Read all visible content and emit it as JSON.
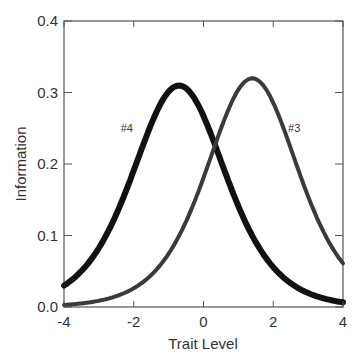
{
  "chart_data": {
    "type": "line",
    "title": "",
    "xlabel": "Trait Level",
    "ylabel": "Information",
    "xlim": [
      -4,
      4
    ],
    "ylim": [
      0,
      0.4
    ],
    "x_ticks": [
      -4,
      -2,
      0,
      2,
      4
    ],
    "x_tick_labels": [
      "-4",
      "-2",
      "0",
      "2",
      "4"
    ],
    "y_ticks": [
      0.0,
      0.1,
      0.2,
      0.3,
      0.4
    ],
    "y_tick_labels": [
      "0.0",
      "0.1",
      "0.2",
      "0.3",
      "0.4"
    ],
    "grid": false,
    "legend": "none (inline curve labels)",
    "x": [
      -4,
      -3.5,
      -3,
      -2.5,
      -2,
      -1.5,
      -1,
      -0.7,
      -0.5,
      0,
      0.3,
      0.5,
      1,
      1.4,
      1.5,
      2,
      2.5,
      3,
      3.5,
      4
    ],
    "series": [
      {
        "name": "#4",
        "color": "#111111",
        "stroke_width": 6,
        "peak": {
          "x": -0.7,
          "y": 0.31
        },
        "values": [
          0.03,
          0.05,
          0.08,
          0.123,
          0.177,
          0.238,
          0.289,
          0.31,
          0.305,
          0.265,
          0.226,
          0.196,
          0.135,
          0.093,
          0.085,
          0.05,
          0.028,
          0.016,
          0.009,
          0.007
        ],
        "label_pos": {
          "x": -2.2,
          "y": 0.245
        }
      },
      {
        "name": "#3",
        "color": "#3a3a3a",
        "stroke_width": 4,
        "peak": {
          "x": 1.4,
          "y": 0.32
        },
        "values": [
          0.003,
          0.005,
          0.008,
          0.014,
          0.024,
          0.041,
          0.069,
          0.093,
          0.11,
          0.17,
          0.215,
          0.245,
          0.302,
          0.32,
          0.318,
          0.286,
          0.215,
          0.15,
          0.097,
          0.061
        ],
        "label_pos": {
          "x": 2.6,
          "y": 0.245
        }
      }
    ],
    "curve_params": [
      {
        "name": "#4",
        "Da": 1.113,
        "b": -0.7
      },
      {
        "name": "#3",
        "Da": 1.131,
        "b": 1.4
      }
    ]
  }
}
